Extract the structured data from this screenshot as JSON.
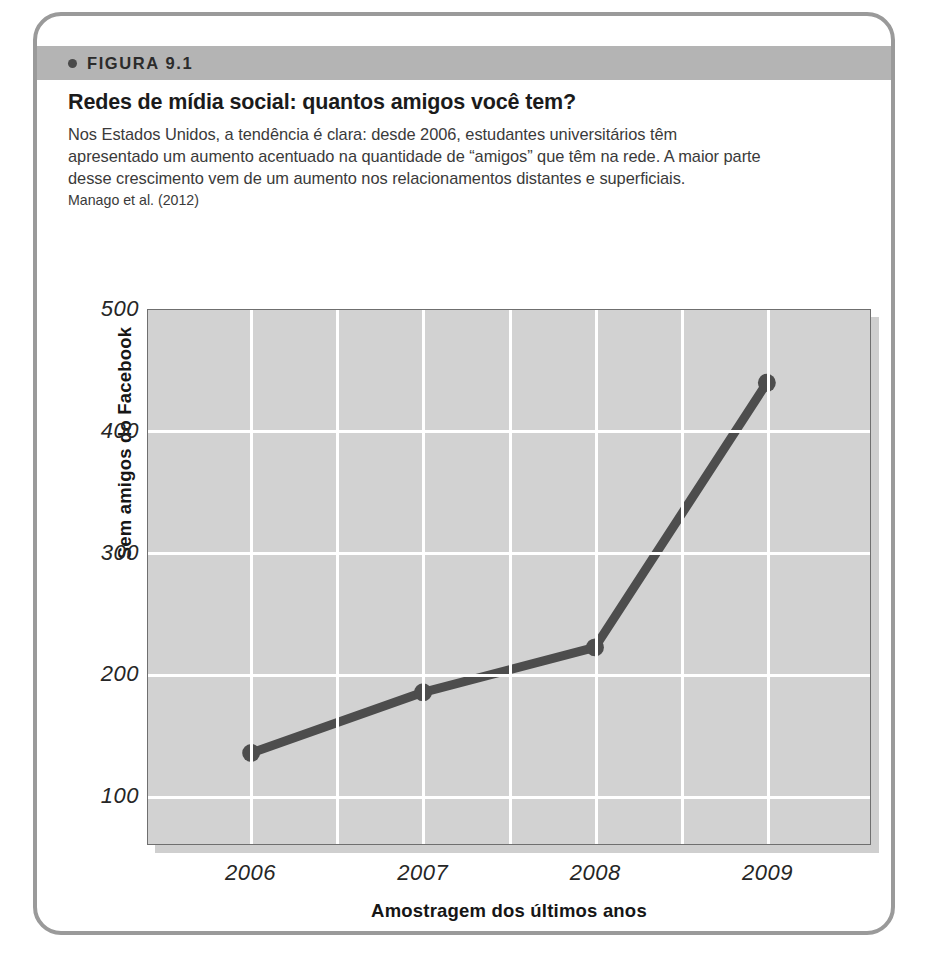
{
  "figure": {
    "label": "FIGURA 9.1",
    "title": "Redes de mídia social: quantos amigos você tem?",
    "body": "Nos Estados Unidos, a tendência é clara: desde 2006, estudantes universitários têm apresentado um aumento acentuado na quantidade de “amigos” que têm na rede. A maior parte desse crescimento vem de um aumento nos relacionamentos distantes e superficiais.",
    "source": "Manago et al. (2012)"
  },
  "colors": {
    "header_band": "#b4b4b4",
    "card_border": "#9a9a9a",
    "plot_background": "#d2d2d2",
    "gridline": "#ffffff",
    "series_line": "#4d4d4d",
    "text": "#1b1b1b"
  },
  "chart_data": {
    "type": "line",
    "title": "",
    "xlabel": "Amostragem dos últimos anos",
    "ylabel": "Sem amigos do Facebook",
    "categories": [
      "2006",
      "2007",
      "2008",
      "2009"
    ],
    "x": [
      2006,
      2007,
      2008,
      2009
    ],
    "values": [
      135,
      185,
      222,
      440
    ],
    "series": [
      {
        "name": "Sem amigos do Facebook",
        "values": [
          135,
          185,
          222,
          440
        ]
      }
    ],
    "yticks": [
      100,
      200,
      300,
      400,
      500
    ],
    "ylim": [
      60,
      500
    ],
    "xlim": [
      2005.4,
      2009.6
    ],
    "grid": true,
    "legend": "none",
    "marker": "circle",
    "tick_label_style": "italic"
  }
}
